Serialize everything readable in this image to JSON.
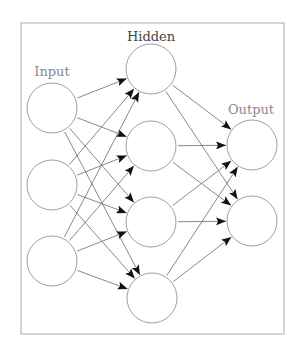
{
  "diagram": {
    "frame": {
      "x": 21,
      "y": 23,
      "width": 263,
      "height": 311,
      "stroke": "#aaaaaa"
    },
    "style": {
      "node_stroke": "#a0a0a0",
      "node_fill": "#ffffff",
      "node_radius": 25,
      "edge_stroke": "#6a6a6a",
      "arrow_fill": "#111111"
    },
    "layers": [
      {
        "id": "input",
        "label": "Input",
        "label_color": "#8a8a8a",
        "label_pos": {
          "x": 52,
          "y": 76
        },
        "nodes": [
          {
            "id": "i1",
            "x": 52,
            "y": 108
          },
          {
            "id": "i2",
            "x": 52,
            "y": 185
          },
          {
            "id": "i3",
            "x": 52,
            "y": 261
          }
        ]
      },
      {
        "id": "hidden",
        "label": "Hidden",
        "label_color": "#444444",
        "label_pos": {
          "x": 151,
          "y": 41
        },
        "nodes": [
          {
            "id": "h1",
            "x": 151,
            "y": 69
          },
          {
            "id": "h2",
            "x": 151,
            "y": 146
          },
          {
            "id": "h3",
            "x": 151,
            "y": 222
          },
          {
            "id": "h4",
            "x": 152,
            "y": 298
          }
        ]
      },
      {
        "id": "output",
        "label": "Output",
        "label_color": "#8a8a8a",
        "label_pos": {
          "x": 251,
          "y": 114
        },
        "nodes": [
          {
            "id": "o1",
            "x": 252,
            "y": 145
          },
          {
            "id": "o2",
            "x": 252,
            "y": 221
          }
        ]
      }
    ],
    "edges": [
      [
        "i1",
        "h1"
      ],
      [
        "i1",
        "h2"
      ],
      [
        "i1",
        "h3"
      ],
      [
        "i1",
        "h4"
      ],
      [
        "i2",
        "h1"
      ],
      [
        "i2",
        "h2"
      ],
      [
        "i2",
        "h3"
      ],
      [
        "i2",
        "h4"
      ],
      [
        "i3",
        "h1"
      ],
      [
        "i3",
        "h2"
      ],
      [
        "i3",
        "h3"
      ],
      [
        "i3",
        "h4"
      ],
      [
        "h1",
        "o1"
      ],
      [
        "h1",
        "o2"
      ],
      [
        "h2",
        "o1"
      ],
      [
        "h2",
        "o2"
      ],
      [
        "h3",
        "o1"
      ],
      [
        "h3",
        "o2"
      ],
      [
        "h4",
        "o1"
      ],
      [
        "h4",
        "o2"
      ]
    ]
  }
}
